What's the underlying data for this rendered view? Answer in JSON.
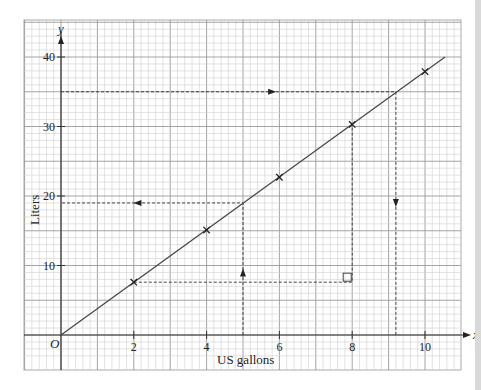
{
  "chart_data": {
    "type": "line",
    "title": "",
    "xlabel": "US gallons",
    "ylabel": "Liters",
    "x_axis_symbol": "x",
    "y_axis_symbol": "y",
    "origin_label": "O",
    "xlim": [
      -1,
      10.9
    ],
    "ylim": [
      -5,
      42
    ],
    "x_ticks": [
      2,
      4,
      6,
      8,
      10
    ],
    "x_tick_labels": [
      "2",
      "4",
      "6",
      "8",
      "10"
    ],
    "y_ticks": [
      10,
      20,
      30,
      40
    ],
    "y_tick_labels": [
      "10",
      "20",
      "30",
      "40"
    ],
    "grid": true,
    "legend": "none",
    "series": [
      {
        "name": "Liters vs US gallons",
        "line_x": [
          0,
          10.55
        ],
        "line_y": [
          0,
          40
        ],
        "points_x": [
          2,
          4,
          6,
          8,
          10
        ],
        "points_y": [
          7.6,
          15.1,
          22.7,
          30.3,
          37.9
        ],
        "marker": "cross",
        "color": "#444444"
      }
    ],
    "annotations": [
      {
        "name": "read-35-liters",
        "kind": "dashed-path",
        "points": [
          [
            0,
            35
          ],
          [
            9.2,
            35
          ],
          [
            9.2,
            0
          ]
        ],
        "arrows": [
          {
            "x": 5.8,
            "y": 35,
            "dir": "right"
          },
          {
            "x": 9.2,
            "y": 19,
            "dir": "down"
          }
        ]
      },
      {
        "name": "read-5-gallons",
        "kind": "dashed-path",
        "points": [
          [
            5,
            0
          ],
          [
            5,
            19
          ],
          [
            0,
            19
          ]
        ],
        "arrows": [
          {
            "x": 5,
            "y": 9,
            "dir": "up"
          },
          {
            "x": 2.1,
            "y": 19,
            "dir": "left"
          }
        ]
      },
      {
        "name": "triangle-construction",
        "kind": "dashed-path",
        "points": [
          [
            2,
            7.6
          ],
          [
            8,
            7.6
          ],
          [
            8,
            30.3
          ]
        ],
        "arrows": []
      },
      {
        "name": "right-angle-marker",
        "kind": "square",
        "x": 8,
        "y": 7.6
      }
    ]
  }
}
